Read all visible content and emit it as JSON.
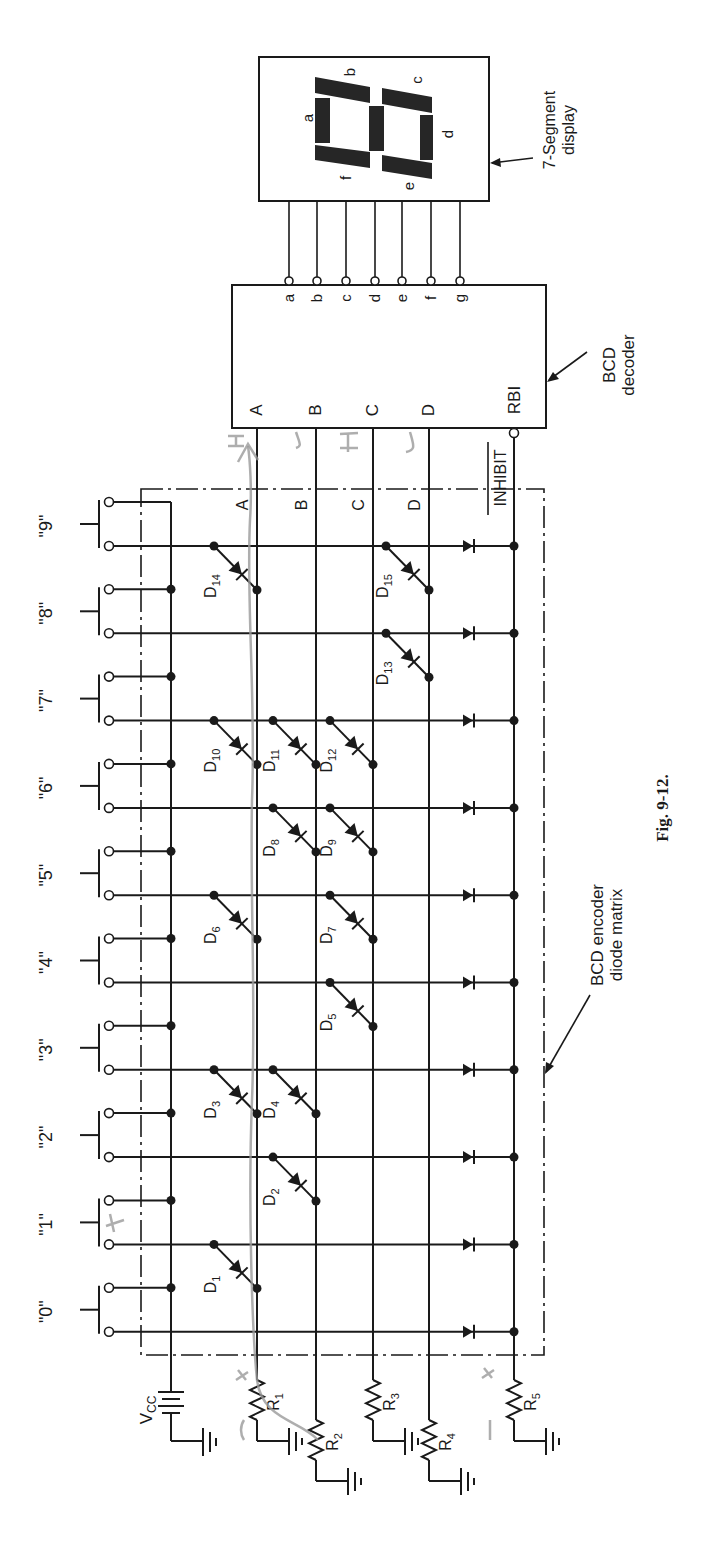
{
  "figure": {
    "caption": "Fig. 9-12.",
    "orientation": "rotated 90° counter-clockwise"
  },
  "components": {
    "display": {
      "label_line1": "7-Segment",
      "label_line2": "display",
      "segments": [
        "a",
        "b",
        "c",
        "d",
        "e",
        "f",
        "g"
      ],
      "segment_labels": {
        "a": "a",
        "b": "b",
        "c": "c",
        "d": "d",
        "e": "e",
        "f": "f"
      }
    },
    "decoder": {
      "label_line1": "BCD",
      "label_line2": "decoder",
      "inputs": [
        "A",
        "B",
        "C",
        "D"
      ],
      "rbi_label": "RBI",
      "outputs": [
        "a",
        "b",
        "c",
        "d",
        "e",
        "f",
        "g"
      ]
    },
    "encoder": {
      "label_line1": "BCD encoder",
      "label_line2": "diode matrix",
      "bus_labels": [
        "A",
        "B",
        "C",
        "D"
      ],
      "inhibit_label": "INHIBIT"
    },
    "switches": [
      "\"0\"",
      "\"1\"",
      "\"2\"",
      "\"3\"",
      "\"4\"",
      "\"5\"",
      "\"6\"",
      "\"7\"",
      "\"8\"",
      "\"9\""
    ],
    "power": {
      "vcc_label": "V",
      "vcc_sub": "CC"
    },
    "resistors": [
      {
        "name": "R",
        "sub": "1",
        "line": "A"
      },
      {
        "name": "R",
        "sub": "2",
        "line": "B"
      },
      {
        "name": "R",
        "sub": "3",
        "line": "C"
      },
      {
        "name": "R",
        "sub": "4",
        "line": "D"
      },
      {
        "name": "R",
        "sub": "5",
        "line": "INHIBIT"
      }
    ],
    "diodes": [
      {
        "name": "D",
        "sub": "1",
        "switch": 1,
        "line": "A"
      },
      {
        "name": "D",
        "sub": "2",
        "switch": 2,
        "line": "B"
      },
      {
        "name": "D",
        "sub": "3",
        "switch": 3,
        "line": "A"
      },
      {
        "name": "D",
        "sub": "4",
        "switch": 3,
        "line": "B"
      },
      {
        "name": "D",
        "sub": "5",
        "switch": 4,
        "line": "C"
      },
      {
        "name": "D",
        "sub": "6",
        "switch": 5,
        "line": "A"
      },
      {
        "name": "D",
        "sub": "7",
        "switch": 5,
        "line": "C"
      },
      {
        "name": "D",
        "sub": "8",
        "switch": 6,
        "line": "B"
      },
      {
        "name": "D",
        "sub": "9",
        "switch": 6,
        "line": "C"
      },
      {
        "name": "D",
        "sub": "10",
        "switch": 7,
        "line": "A"
      },
      {
        "name": "D",
        "sub": "11",
        "switch": 7,
        "line": "B"
      },
      {
        "name": "D",
        "sub": "12",
        "switch": 7,
        "line": "C"
      },
      {
        "name": "D",
        "sub": "13",
        "switch": 8,
        "line": "D"
      },
      {
        "name": "D",
        "sub": "14",
        "switch": 9,
        "line": "A"
      },
      {
        "name": "D",
        "sub": "15",
        "switch": 9,
        "line": "D"
      }
    ]
  },
  "annotations": {
    "handwritten_marks": [
      "H",
      "L",
      "H",
      "L",
      "+",
      "+",
      "-",
      "-"
    ]
  }
}
